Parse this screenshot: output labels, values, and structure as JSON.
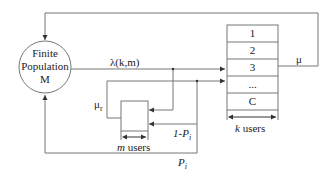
{
  "diagram": {
    "source_node": {
      "line1": "Finite",
      "line2": "Population",
      "line3": "M"
    },
    "arrival_rate_label": "λ(k,m)",
    "service_rate_label": "μ",
    "retrial_rate_label": "μ",
    "retrial_rate_subscript": "r",
    "server_slots": [
      "1",
      "2",
      "3",
      "...",
      "C"
    ],
    "k_users_label": {
      "var": "k",
      "text": " users"
    },
    "m_users_label": {
      "var": "m",
      "text": " users"
    },
    "retry_prob_label": "1-P",
    "retry_prob_subscript": "i",
    "leave_prob_label": "P",
    "leave_prob_subscript": "i",
    "line_color": "#777777"
  }
}
